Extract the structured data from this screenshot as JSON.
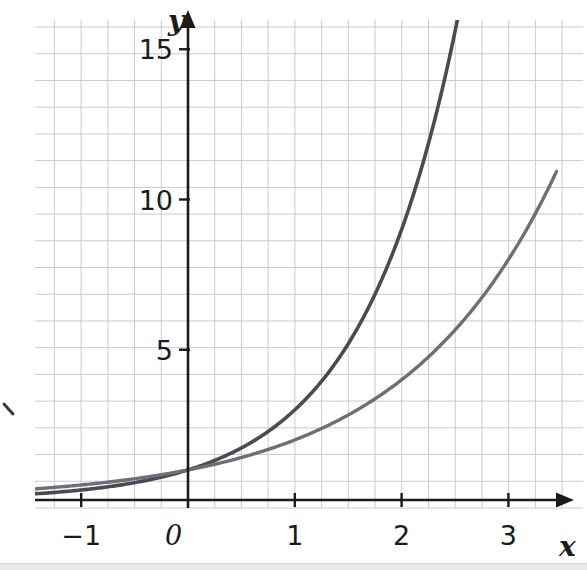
{
  "chart_data": {
    "type": "line",
    "title": "",
    "subtitle": "",
    "xlabel": "x",
    "ylabel": "y",
    "origin_label": "0",
    "xlim": [
      -1.43,
      3.72
    ],
    "ylim": [
      -0.3,
      16.3
    ],
    "x_ticks": [
      -1,
      0,
      1,
      2,
      3
    ],
    "x_tick_labels": [
      "−1",
      "0",
      "1",
      "2",
      "3"
    ],
    "y_ticks": [
      5,
      10,
      15
    ],
    "y_tick_labels": [
      "5",
      "10",
      "15"
    ],
    "grid": true,
    "grid_minor_step_x": 0.25,
    "grid_minor_step_y": 0.8889,
    "grid_color": "#c9c9d2",
    "axis_color": "#1b1b1b",
    "legend": "none",
    "annotations": [],
    "series": [
      {
        "name": "y = 3^x",
        "base": 3,
        "color": "#4a4a52",
        "stroke_width": 3.6,
        "x_start": -1.43,
        "x_end": 2.6,
        "points": [
          {
            "x": -1.4,
            "y": 0.214
          },
          {
            "x": -1.2,
            "y": 0.268
          },
          {
            "x": -1.0,
            "y": 0.333
          },
          {
            "x": -0.8,
            "y": 0.415
          },
          {
            "x": -0.6,
            "y": 0.518
          },
          {
            "x": -0.4,
            "y": 0.644
          },
          {
            "x": -0.2,
            "y": 0.803
          },
          {
            "x": 0.0,
            "y": 1.0
          },
          {
            "x": 0.25,
            "y": 1.316
          },
          {
            "x": 0.5,
            "y": 1.732
          },
          {
            "x": 0.75,
            "y": 2.28
          },
          {
            "x": 1.0,
            "y": 3.0
          },
          {
            "x": 1.25,
            "y": 3.948
          },
          {
            "x": 1.5,
            "y": 5.196
          },
          {
            "x": 1.75,
            "y": 6.839
          },
          {
            "x": 2.0,
            "y": 9.0
          },
          {
            "x": 2.25,
            "y": 11.845
          },
          {
            "x": 2.5,
            "y": 15.588
          },
          {
            "x": 2.58,
            "y": 16.9
          }
        ]
      },
      {
        "name": "y = 2^x",
        "base": 2,
        "color": "#6e6e78",
        "stroke_width": 3.4,
        "x_start": -1.43,
        "x_end": 3.45,
        "points": [
          {
            "x": -1.4,
            "y": 0.379
          },
          {
            "x": -1.2,
            "y": 0.435
          },
          {
            "x": -1.0,
            "y": 0.5
          },
          {
            "x": -0.8,
            "y": 0.574
          },
          {
            "x": -0.6,
            "y": 0.66
          },
          {
            "x": -0.4,
            "y": 0.758
          },
          {
            "x": -0.2,
            "y": 0.871
          },
          {
            "x": 0.0,
            "y": 1.0
          },
          {
            "x": 0.25,
            "y": 1.189
          },
          {
            "x": 0.5,
            "y": 1.414
          },
          {
            "x": 0.75,
            "y": 1.682
          },
          {
            "x": 1.0,
            "y": 2.0
          },
          {
            "x": 1.25,
            "y": 2.378
          },
          {
            "x": 1.5,
            "y": 2.828
          },
          {
            "x": 1.75,
            "y": 3.364
          },
          {
            "x": 2.0,
            "y": 4.0
          },
          {
            "x": 2.25,
            "y": 4.757
          },
          {
            "x": 2.5,
            "y": 5.657
          },
          {
            "x": 2.75,
            "y": 6.727
          },
          {
            "x": 3.0,
            "y": 8.0
          },
          {
            "x": 3.25,
            "y": 9.514
          },
          {
            "x": 3.45,
            "y": 10.93
          }
        ]
      }
    ]
  },
  "axes": {
    "x_axis_label": "x",
    "y_axis_label": "y",
    "origin": "0"
  },
  "ticks": {
    "x": [
      "−1",
      "0",
      "1",
      "2",
      "3"
    ],
    "y": [
      "5",
      "10",
      "15"
    ]
  }
}
